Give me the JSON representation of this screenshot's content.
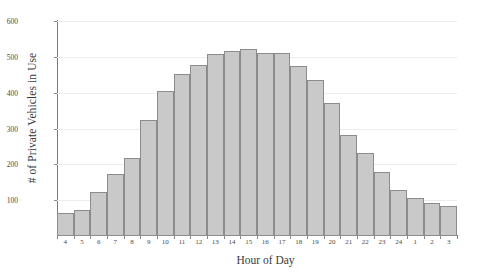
{
  "chart_data": {
    "type": "bar",
    "title": "",
    "xlabel": "Hour of Day",
    "ylabel": "# of Private Vehicles in Use",
    "categories": [
      "4",
      "5",
      "6",
      "7",
      "8",
      "9",
      "10",
      "11",
      "12",
      "13",
      "14",
      "15",
      "16",
      "17",
      "18",
      "19",
      "20",
      "21",
      "22",
      "23",
      "24",
      "1",
      "2",
      "3"
    ],
    "values": [
      65,
      72,
      122,
      172,
      218,
      325,
      405,
      453,
      478,
      508,
      515,
      523,
      512,
      510,
      475,
      435,
      372,
      282,
      232,
      178,
      128,
      105,
      92,
      85
    ],
    "ylim": [
      0,
      600
    ],
    "yticks": [
      100,
      200,
      300,
      400,
      500,
      600
    ],
    "ytick_labels": [
      "100",
      "200",
      "300",
      "400",
      "500",
      "600"
    ],
    "grid": true,
    "legend": null,
    "bar_color": "#c9c9c9",
    "bar_edge_color": "#8c8c8c",
    "grid_color": "#ececed",
    "axis_color": "#6e6e6e",
    "background": "#ffffff"
  }
}
